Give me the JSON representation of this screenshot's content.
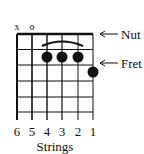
{
  "diagram": {
    "type": "guitar-chord-chart",
    "string_markers": [
      {
        "string": 6,
        "symbol": "x"
      },
      {
        "string": 5,
        "symbol": "o"
      }
    ],
    "labels": {
      "nut": "Nut",
      "fret": "Fret",
      "strings_caption": "Strings"
    },
    "string_numbers": [
      "6",
      "5",
      "4",
      "3",
      "2",
      "1"
    ],
    "fingers": [
      {
        "string": 4,
        "fret": 2
      },
      {
        "string": 3,
        "fret": 2
      },
      {
        "string": 2,
        "fret": 2
      },
      {
        "string": 1,
        "fret": 3
      }
    ],
    "barre": {
      "from_string": 4,
      "to_string": 2,
      "fret": 2
    },
    "frets_shown": 5,
    "colors": {
      "line": "#111111",
      "dot": "#111111",
      "background": "#ffffff"
    }
  }
}
